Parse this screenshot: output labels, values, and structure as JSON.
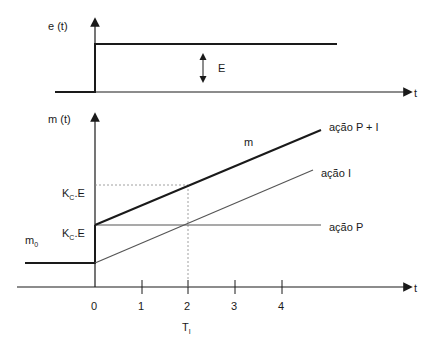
{
  "top_plot": {
    "y_label": "e (t)",
    "x_label": "t",
    "step_label": "E"
  },
  "bottom_plot": {
    "y_label": "m (t)",
    "x_label": "t",
    "m0_label": "m",
    "m0_sub": "0",
    "kce_top_label_main": "K",
    "kce_top_label_sub": "C",
    "kce_top_label_tail": ".E",
    "kce_bottom_label_main": "K",
    "kce_bottom_label_sub": "C",
    "kce_bottom_label_tail": ".E",
    "m_label": "m",
    "ti_main": "T",
    "ti_sub": "I",
    "ticks": [
      "0",
      "1",
      "2",
      "3",
      "4"
    ],
    "legend": {
      "pi": "ação P + I",
      "i": "ação I",
      "p": "ação P"
    }
  }
}
